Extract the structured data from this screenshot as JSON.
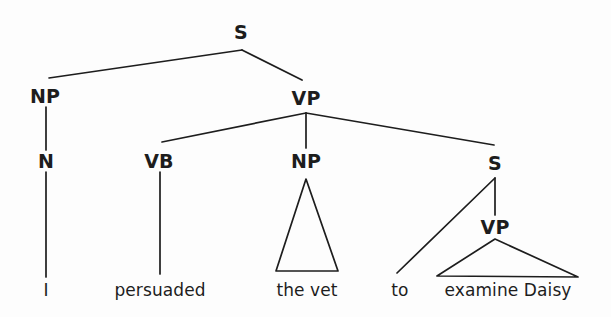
{
  "figure": {
    "type": "syntax-tree",
    "sentence": "I persuaded the vet to examine Daisy",
    "background_color": "#fdfdfd",
    "line_color": "#1d1d1d"
  },
  "nodes": [
    {
      "id": "s-root",
      "label": "S",
      "x": 241,
      "y": 32,
      "kind": "nonterminal"
    },
    {
      "id": "np-1",
      "label": "NP",
      "x": 45,
      "y": 96,
      "kind": "nonterminal"
    },
    {
      "id": "vp-1",
      "label": "VP",
      "x": 306,
      "y": 98,
      "kind": "nonterminal"
    },
    {
      "id": "n-1",
      "label": "N",
      "x": 46,
      "y": 161,
      "kind": "nonterminal"
    },
    {
      "id": "vb-1",
      "label": "VB",
      "x": 159,
      "y": 161,
      "kind": "nonterminal"
    },
    {
      "id": "np-2",
      "label": "NP",
      "x": 306,
      "y": 161,
      "kind": "nonterminal"
    },
    {
      "id": "s-embed",
      "label": "S",
      "x": 495,
      "y": 163,
      "kind": "nonterminal"
    },
    {
      "id": "vp-2",
      "label": "VP",
      "x": 495,
      "y": 227,
      "kind": "nonterminal"
    }
  ],
  "leaves": [
    {
      "id": "leaf-i",
      "label": "I",
      "x": 46,
      "y": 290
    },
    {
      "id": "leaf-persuaded",
      "label": "persuaded",
      "x": 160,
      "y": 290
    },
    {
      "id": "leaf-the-vet",
      "label": "the vet",
      "x": 307,
      "y": 290
    },
    {
      "id": "leaf-to",
      "label": "to",
      "x": 400,
      "y": 290
    },
    {
      "id": "leaf-examine",
      "label": "examine Daisy",
      "x": 508,
      "y": 290
    }
  ],
  "edges": [
    {
      "id": "edge-s-np",
      "from": "s-root",
      "to": "np-1",
      "x1": 242,
      "y1": 50,
      "x2": 49,
      "y2": 78
    },
    {
      "id": "edge-s-vp",
      "from": "s-root",
      "to": "vp-1",
      "x1": 242,
      "y1": 50,
      "x2": 302,
      "y2": 80
    },
    {
      "id": "edge-np-n",
      "from": "np-1",
      "to": "n-1",
      "x1": 46,
      "y1": 107,
      "x2": 46,
      "y2": 150
    },
    {
      "id": "edge-n-i",
      "from": "n-1",
      "to": "leaf-i",
      "x1": 46,
      "y1": 172,
      "x2": 46,
      "y2": 277
    },
    {
      "id": "edge-vp-vb",
      "from": "vp-1",
      "to": "vb-1",
      "x1": 306,
      "y1": 113,
      "x2": 162,
      "y2": 142
    },
    {
      "id": "edge-vp-np2",
      "from": "vp-1",
      "to": "np-2",
      "x1": 306,
      "y1": 113,
      "x2": 306,
      "y2": 148
    },
    {
      "id": "edge-vp-s",
      "from": "vp-1",
      "to": "s-embed",
      "x1": 306,
      "y1": 113,
      "x2": 494,
      "y2": 145
    },
    {
      "id": "edge-vb-persuaded",
      "from": "vb-1",
      "to": "leaf-persuaded",
      "x1": 160,
      "y1": 172,
      "x2": 160,
      "y2": 274
    },
    {
      "id": "edge-s2-to",
      "from": "s-embed",
      "to": "leaf-to",
      "x1": 495,
      "y1": 178,
      "x2": 397,
      "y2": 273
    },
    {
      "id": "edge-s2-vp2",
      "from": "s-embed",
      "to": "vp-2",
      "x1": 495,
      "y1": 178,
      "x2": 495,
      "y2": 215
    }
  ],
  "triangles": [
    {
      "id": "triangle-np2",
      "parent": "np-2",
      "covers": "the vet",
      "apex_x": 306,
      "apex_y": 179,
      "left_x": 276,
      "left_y": 271,
      "right_x": 338,
      "right_y": 271
    },
    {
      "id": "triangle-vp2",
      "parent": "vp-2",
      "covers": "examine Daisy",
      "apex_x": 495,
      "apex_y": 239,
      "left_x": 437,
      "left_y": 276,
      "right_x": 578,
      "right_y": 277
    }
  ]
}
